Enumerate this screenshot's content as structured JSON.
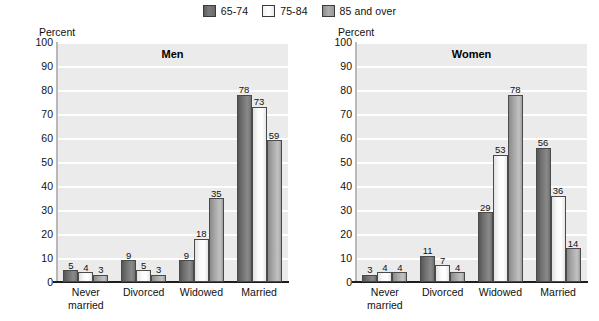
{
  "legend": {
    "items": [
      {
        "label": "65-74",
        "swatch": "dark-gray"
      },
      {
        "label": "75-84",
        "swatch": "white"
      },
      {
        "label": "85 and over",
        "swatch": "medium-gray"
      }
    ]
  },
  "axis": {
    "y_label": "Percent",
    "y_ticks": [
      "100",
      "90",
      "80",
      "70",
      "60",
      "50",
      "40",
      "30",
      "20",
      "10",
      "0"
    ]
  },
  "chart_data": [
    {
      "type": "bar",
      "title": "Men",
      "xlabel": "",
      "ylabel": "Percent",
      "ylim": [
        0,
        100
      ],
      "grid": true,
      "legend_position": "top-center",
      "categories": [
        "Never married",
        "Divorced",
        "Widowed",
        "Married"
      ],
      "category_lines": [
        [
          "Never",
          "married"
        ],
        [
          "Divorced"
        ],
        [
          "Widowed"
        ],
        [
          "Married"
        ]
      ],
      "series": [
        {
          "name": "65-74",
          "values": [
            5,
            9,
            9,
            78
          ]
        },
        {
          "name": "75-84",
          "values": [
            4,
            5,
            18,
            73
          ]
        },
        {
          "name": "85 and over",
          "values": [
            3,
            3,
            35,
            59
          ]
        }
      ]
    },
    {
      "type": "bar",
      "title": "Women",
      "xlabel": "",
      "ylabel": "Percent",
      "ylim": [
        0,
        100
      ],
      "grid": true,
      "legend_position": "top-center",
      "categories": [
        "Never married",
        "Divorced",
        "Widowed",
        "Married"
      ],
      "category_lines": [
        [
          "Never",
          "married"
        ],
        [
          "Divorced"
        ],
        [
          "Widowed"
        ],
        [
          "Married"
        ]
      ],
      "series": [
        {
          "name": "65-74",
          "values": [
            3,
            11,
            29,
            56
          ]
        },
        {
          "name": "75-84",
          "values": [
            4,
            7,
            53,
            36
          ]
        },
        {
          "name": "85 and over",
          "values": [
            4,
            4,
            78,
            14
          ]
        }
      ]
    }
  ],
  "colors": {
    "series_65_74": "#6e6e6e",
    "series_75_84": "#fbfbfb",
    "series_85_over": "#a6a6a6",
    "plot_background": "#ebebeb",
    "gridline": "#ffffff",
    "axis": "#1d1d1d"
  }
}
